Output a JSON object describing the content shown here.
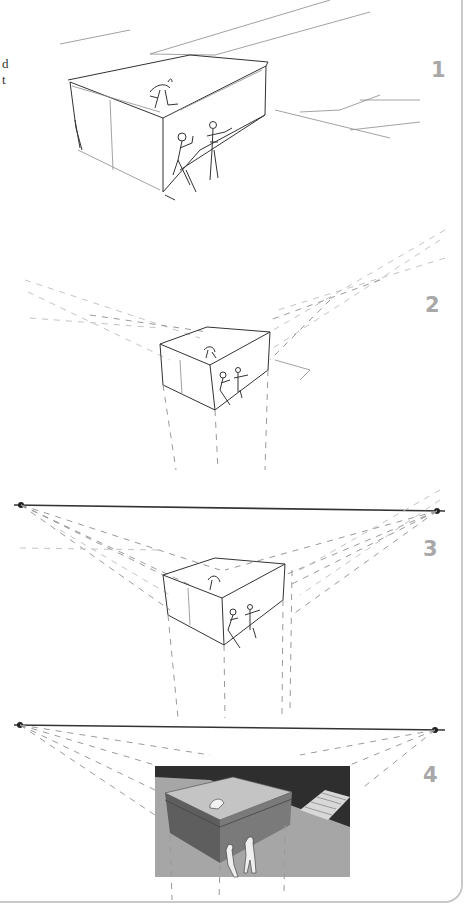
{
  "page": {
    "corner_text": [
      "d",
      "t"
    ]
  },
  "steps": [
    {
      "number": "1",
      "description": "rough sketch of box with figures"
    },
    {
      "number": "2",
      "description": "box with dashed perspective construction lines"
    },
    {
      "number": "3",
      "description": "horizon line with two vanishing points"
    },
    {
      "number": "4",
      "description": "finished shaded rendering with horizon line"
    }
  ],
  "colors": {
    "step_number": "#a8a8a8",
    "sketch_line": "#333333",
    "construction_line": "#9a9a9a",
    "render_dark": "#2e2e2e",
    "render_ground": "#a6a6a6",
    "render_box_top": "#c4c4c4",
    "render_box_side": "#6e6e6e"
  }
}
